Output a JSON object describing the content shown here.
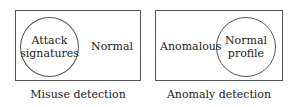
{
  "diagrams": [
    {
      "caption": "Misuse detection",
      "circle_label_line1": "Attack",
      "circle_label_line2": "signatures",
      "outside_label": "Normal"
    },
    {
      "caption": "Anomaly detection",
      "circle_label_line1": "Normal",
      "circle_label_line2": "profile",
      "outside_label": "Anomalous"
    }
  ],
  "colors": {
    "stroke": "#555555",
    "text": "#222222",
    "background": "#ffffff"
  }
}
